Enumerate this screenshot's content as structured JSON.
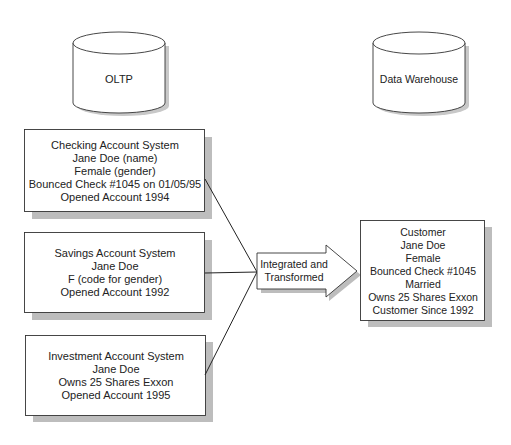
{
  "sources": {
    "title": "OLTP",
    "systems": [
      {
        "lines": [
          "Checking Account System",
          "Jane Doe (name)",
          "Female (gender)",
          "Bounced Check #1045 on 01/05/95",
          "Opened Account 1994"
        ]
      },
      {
        "lines": [
          "Savings Account System",
          "Jane Doe",
          "F (code for gender)",
          "Opened Account 1992"
        ]
      },
      {
        "lines": [
          "Investment Account System",
          "Jane Doe",
          "Owns 25 Shares Exxon",
          "Opened Account 1995"
        ]
      }
    ]
  },
  "process": {
    "lines": [
      "Integrated and",
      "Transformed"
    ]
  },
  "target": {
    "title": "Data Warehouse",
    "record": {
      "lines": [
        "Customer",
        "Jane Doe",
        "Female",
        "Bounced Check #1045",
        "Married",
        "Owns 25 Shares Exxon",
        "Customer Since 1992"
      ]
    }
  },
  "colors": {
    "stroke": "#333333",
    "shadow": "#b8b8b8",
    "fill": "#ffffff"
  }
}
